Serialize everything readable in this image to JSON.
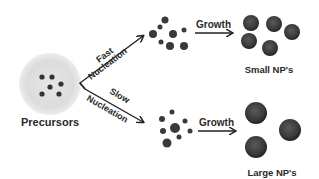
{
  "diagram": {
    "source": {
      "label": "Precursors",
      "dots": [
        [
          42,
          77
        ],
        [
          52,
          77
        ],
        [
          61,
          84
        ],
        [
          50,
          87
        ],
        [
          42,
          94
        ],
        [
          59,
          94
        ]
      ]
    },
    "paths": [
      {
        "id": "fast",
        "label_top": "Fast",
        "label_bottom": "Nucleation",
        "nuclei": [
          {
            "x": 165,
            "y": 20,
            "r": 3.5
          },
          {
            "x": 160,
            "y": 27,
            "r": 2.5
          },
          {
            "x": 153,
            "y": 34,
            "r": 4
          },
          {
            "x": 173,
            "y": 34,
            "r": 4
          },
          {
            "x": 184,
            "y": 30,
            "r": 2.5
          },
          {
            "x": 161,
            "y": 42,
            "r": 2.5
          },
          {
            "x": 170,
            "y": 46,
            "r": 4
          },
          {
            "x": 184,
            "y": 46,
            "r": 4
          }
        ],
        "growth_label": "Growth",
        "product_label": "Small NP's",
        "particles": [
          {
            "x": 251,
            "y": 23,
            "r": 8
          },
          {
            "x": 274,
            "y": 24,
            "r": 8
          },
          {
            "x": 292,
            "y": 32,
            "r": 8
          },
          {
            "x": 249,
            "y": 41,
            "r": 8
          },
          {
            "x": 270,
            "y": 48,
            "r": 8
          }
        ]
      },
      {
        "id": "slow",
        "label_top": "Slow",
        "label_bottom": "Nucleation",
        "nuclei": [
          {
            "x": 172,
            "y": 112,
            "r": 2.5
          },
          {
            "x": 162,
            "y": 119,
            "r": 3
          },
          {
            "x": 185,
            "y": 121,
            "r": 2.5
          },
          {
            "x": 175,
            "y": 128,
            "r": 5
          },
          {
            "x": 163,
            "y": 131,
            "r": 3
          },
          {
            "x": 190,
            "y": 131,
            "r": 2.5
          },
          {
            "x": 179,
            "y": 137,
            "r": 2.5
          },
          {
            "x": 167,
            "y": 143,
            "r": 4.5
          }
        ],
        "growth_label": "Growth",
        "product_label": "Large NP's",
        "particles": [
          {
            "x": 256,
            "y": 113,
            "r": 11
          },
          {
            "x": 290,
            "y": 130,
            "r": 11
          },
          {
            "x": 256,
            "y": 147,
            "r": 11
          }
        ]
      }
    ],
    "colors": {
      "background": "#ffffff",
      "text": "#2a2a2a",
      "particle": "#3a3a3a",
      "precursor_halo": "#d8d8d8"
    }
  }
}
